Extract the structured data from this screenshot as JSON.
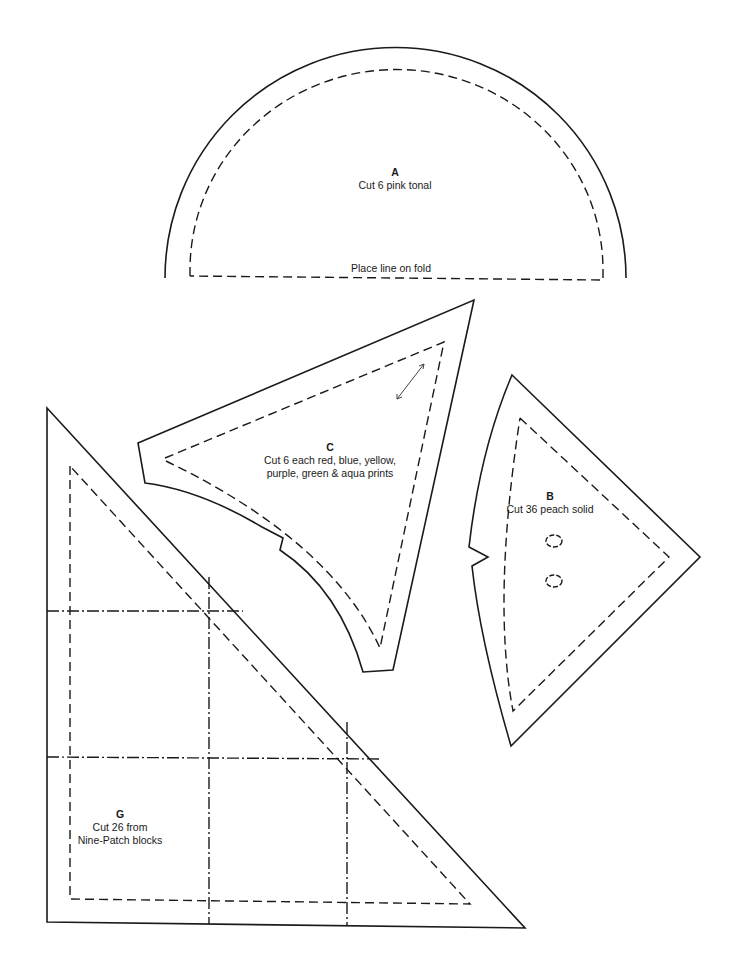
{
  "pieces": {
    "A": {
      "letter": "A",
      "instruction": "Cut 6 pink tonal",
      "fold_label": "Place line on fold"
    },
    "C": {
      "letter": "C",
      "instruction_line1": "Cut 6 each red, blue, yellow,",
      "instruction_line2": "purple, green & aqua prints"
    },
    "B": {
      "letter": "B",
      "instruction": "Cut 36 peach solid"
    },
    "G": {
      "letter": "G",
      "instruction_line1": "Cut 26 from",
      "instruction_line2": "Nine-Patch blocks"
    }
  },
  "colors": {
    "line": "#1a1a1a",
    "background": "#ffffff"
  }
}
